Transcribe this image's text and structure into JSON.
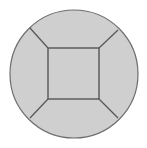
{
  "diagram": {
    "type": "geometric-figure",
    "colors": {
      "fill": "#cfcfcf",
      "stroke": "#6e6e6e",
      "background": "#ffffff"
    },
    "circle": {
      "cx": 74,
      "cy": 74,
      "r": 64
    },
    "square": {
      "x": 48,
      "y": 48,
      "size": 51
    },
    "spokes": [
      {
        "x1": 48,
        "y1": 48,
        "x2": 30,
        "y2": 28
      },
      {
        "x1": 99,
        "y1": 48,
        "x2": 118,
        "y2": 30
      },
      {
        "x1": 48,
        "y1": 99,
        "x2": 30,
        "y2": 118
      },
      {
        "x1": 99,
        "y1": 99,
        "x2": 118,
        "y2": 118
      }
    ]
  }
}
